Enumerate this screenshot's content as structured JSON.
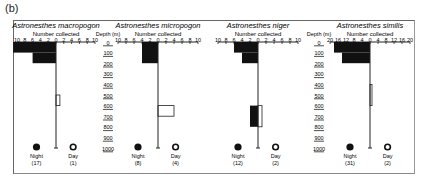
{
  "panel_label": "(b)",
  "chart_data": {
    "type": "bar",
    "subtype": "vertical-distribution (kite) diagram",
    "depth_axis": {
      "label": "Depth (m)",
      "ticks": [
        0,
        100,
        200,
        300,
        400,
        500,
        600,
        700,
        800,
        900,
        1000
      ],
      "range": [
        0,
        1000
      ]
    },
    "x_axis_label": "Number collected",
    "legend": [
      {
        "name": "Night",
        "symbol": "filled-circle",
        "side": "left"
      },
      {
        "name": "Day",
        "symbol": "open-circle",
        "side": "right"
      }
    ],
    "panels": [
      {
        "species": "Astronesthes macropogon",
        "scale_max": 10,
        "ticks": [
          "10",
          "8",
          "6",
          "4",
          "2",
          "0",
          "2",
          "4",
          "6",
          "8",
          "10"
        ],
        "night_n": "(17)",
        "day_n": "(1)",
        "night_bins": [
          {
            "depth": [
              0,
              100
            ],
            "count": 11
          },
          {
            "depth": [
              100,
              200
            ],
            "count": 6
          }
        ],
        "day_bins": [
          {
            "depth": [
              500,
              600
            ],
            "count": 1
          }
        ]
      },
      {
        "species": "Astronesthes micropogon",
        "scale_max": 10,
        "ticks": [
          "10",
          "8",
          "6",
          "4",
          "2",
          "0",
          "2",
          "4",
          "6",
          "8",
          "10"
        ],
        "night_n": "(8)",
        "day_n": "(4)",
        "night_bins": [
          {
            "depth": [
              0,
              200
            ],
            "count": 4
          }
        ],
        "day_bins": [
          {
            "depth": [
              600,
              700
            ],
            "count": 4
          }
        ]
      },
      {
        "species": "Astronesthes niger",
        "scale_max": 10,
        "ticks": [
          "10",
          "8",
          "6",
          "4",
          "2",
          "0",
          "2",
          "4",
          "6",
          "8",
          "10"
        ],
        "night_n": "(12)",
        "day_n": "(2)",
        "night_bins": [
          {
            "depth": [
              0,
              100
            ],
            "count": 6
          },
          {
            "depth": [
              100,
              200
            ],
            "count": 4
          },
          {
            "depth": [
              600,
              800
            ],
            "count": 2
          }
        ],
        "day_bins": [
          {
            "depth": [
              600,
              800
            ],
            "count": 1
          }
        ]
      },
      {
        "species": "Astronesthes similis",
        "scale_max": 20,
        "ticks": [
          "20",
          "16",
          "12",
          "8",
          "4",
          "0",
          "4",
          "8",
          "12",
          "16",
          "20"
        ],
        "night_n": "(31)",
        "day_n": "(2)",
        "night_bins": [
          {
            "depth": [
              0,
              100
            ],
            "count": 18
          },
          {
            "depth": [
              100,
              200
            ],
            "count": 14
          }
        ],
        "day_bins": [
          {
            "depth": [
              400,
              600
            ],
            "count": 1
          }
        ]
      }
    ]
  }
}
